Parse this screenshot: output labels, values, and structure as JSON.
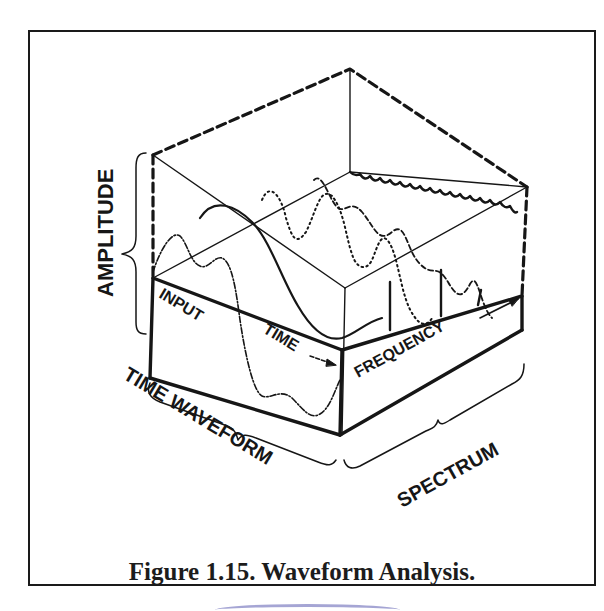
{
  "figure": {
    "caption": "Figure 1.15. Waveform Analysis.",
    "labels": {
      "amplitude": "AMPLITUDE",
      "input": "INPUT",
      "time": "TIME",
      "frequency": "FREQUENCY",
      "time_waveform": "TIME WAVEFORM",
      "spectrum": "SPECTRUM"
    },
    "colors": {
      "ink": "#161616",
      "background": "#ffffff",
      "smear": "#6a6ab8"
    }
  }
}
